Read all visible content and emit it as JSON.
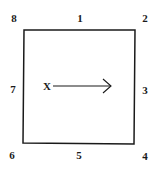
{
  "diagram": {
    "square": {
      "stroke": "#1a1a1a"
    },
    "center_label": "X",
    "arrow_direction": "right",
    "positions": [
      {
        "id": "8",
        "label": "8",
        "x": 14,
        "y": 18
      },
      {
        "id": "1",
        "label": "1",
        "x": 80,
        "y": 18
      },
      {
        "id": "2",
        "label": "2",
        "x": 145,
        "y": 18
      },
      {
        "id": "7",
        "label": "7",
        "x": 13,
        "y": 89
      },
      {
        "id": "3",
        "label": "3",
        "x": 145,
        "y": 90
      },
      {
        "id": "6",
        "label": "6",
        "x": 12,
        "y": 155
      },
      {
        "id": "5",
        "label": "5",
        "x": 79,
        "y": 155
      },
      {
        "id": "4",
        "label": "4",
        "x": 145,
        "y": 156
      }
    ]
  }
}
